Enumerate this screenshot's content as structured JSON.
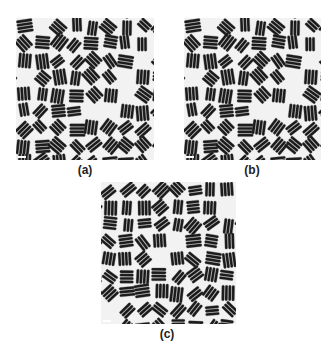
{
  "figure": {
    "panels": [
      {
        "id": "a",
        "label": "(a)",
        "description": "TEM micrograph of densely packed nanorods"
      },
      {
        "id": "b",
        "label": "(b)",
        "description": "TEM micrograph of densely packed nanorods"
      },
      {
        "id": "c",
        "label": "(c)",
        "description": "TEM micrograph of densely packed nanorods"
      }
    ],
    "colors": {
      "rod": "#1a1a1a",
      "background": "#f2f2f2",
      "rod_highlight": "#555555"
    }
  }
}
